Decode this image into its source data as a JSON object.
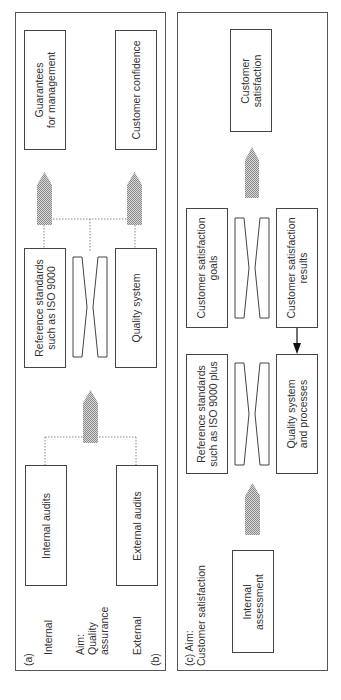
{
  "panel_ab": {
    "label_a": "(a)",
    "label_b": "(b)",
    "side_internal": "Internal",
    "side_aim": [
      "Aim:",
      "Quality",
      "assurance"
    ],
    "side_external": "External",
    "boxes": {
      "guarantees": [
        "Guarantees",
        "for management"
      ],
      "customer_confidence": [
        "Customer confidence"
      ],
      "reference_standards": [
        "Reference standards",
        "such as ISO 9000"
      ],
      "quality_system": [
        "Quality system"
      ],
      "internal_audits": [
        "Internal audits"
      ],
      "external_audits": [
        "External audits"
      ]
    }
  },
  "panel_c": {
    "label": [
      "(c) Aim:",
      "Customer satisfaction"
    ],
    "boxes": {
      "customer_satisfaction": [
        "Customer",
        "satisfaction"
      ],
      "cs_goals": [
        "Customer satisfaction",
        "goals"
      ],
      "cs_results": [
        "Customer satisfaction",
        "results"
      ],
      "reference_standards_plus": [
        "Reference standards",
        "such as ISO 9000 plus"
      ],
      "quality_system_processes": [
        "Quality system",
        "and processes"
      ],
      "internal_assessment": [
        "Internal",
        "assessment"
      ]
    }
  },
  "colors": {
    "border": "#444444",
    "hatched_arrow": "#a8a8a8",
    "dotted_line": "#888888",
    "solid_arrow": "#111111"
  }
}
